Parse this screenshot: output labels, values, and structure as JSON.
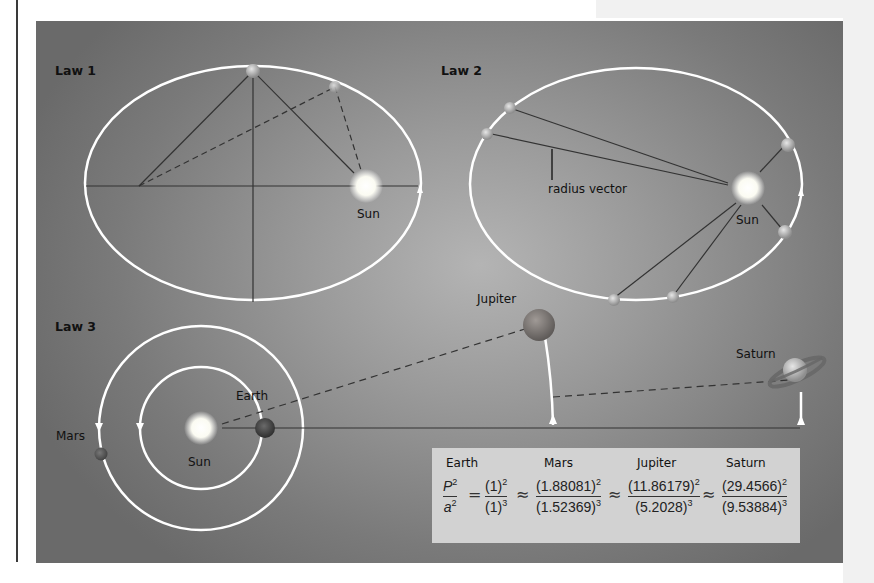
{
  "law1": {
    "title": "Law 1",
    "sun_label": "Sun"
  },
  "law2": {
    "title": "Law 2",
    "radius_label": "radius vector",
    "sun_label": "Sun"
  },
  "law3": {
    "title": "Law 3",
    "sun_label": "Sun",
    "planets": {
      "earth": "Earth",
      "mars": "Mars",
      "jupiter": "Jupiter",
      "saturn": "Saturn"
    }
  },
  "formula": {
    "headers": [
      "Earth",
      "Mars",
      "Jupiter",
      "Saturn"
    ],
    "lhs": {
      "num": "P",
      "num_exp": "2",
      "den": "a",
      "den_exp": "2"
    },
    "equals": "=",
    "approx": "≈",
    "terms": [
      {
        "num": "(1)",
        "num_exp": "2",
        "den": "(1)",
        "den_exp": "3"
      },
      {
        "num": "(1.88081)",
        "num_exp": "2",
        "den": "(1.52369)",
        "den_exp": "3"
      },
      {
        "num": "(11.86179)",
        "num_exp": "2",
        "den": "(5.2028)",
        "den_exp": "3"
      },
      {
        "num": "(29.4566)",
        "num_exp": "2",
        "den": "(9.53884)",
        "den_exp": "3"
      }
    ]
  },
  "colors": {
    "orbit": "#ffffff",
    "line": "#333333",
    "box": "#d2d2d2"
  }
}
